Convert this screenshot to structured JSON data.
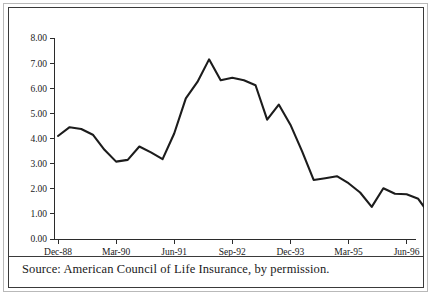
{
  "figure": {
    "source_caption": "Source: American Council of Life Insurance, by permission."
  },
  "chart_data": {
    "type": "line",
    "title": "",
    "subtitle": "",
    "xlabel": "",
    "ylabel": "",
    "grid": false,
    "legend": false,
    "legend_position": "none",
    "line_color": "#1c1c1c",
    "axis_color": "#2b2b2b",
    "background": "#ffffff",
    "ylim": [
      0.0,
      8.0
    ],
    "ytick_labels": [
      "8.00",
      "7.00",
      "6.00",
      "5.00",
      "4.00",
      "3.00",
      "2.00",
      "1.00",
      "0.00"
    ],
    "ytick_values": [
      8.0,
      7.0,
      6.0,
      5.0,
      4.0,
      3.0,
      2.0,
      1.0,
      0.0
    ],
    "xtick_labels": [
      "Dec-88",
      "Mar-90",
      "Jun-91",
      "Sep-92",
      "Dec-93",
      "Mar-95",
      "Jun-96"
    ],
    "xtick_indices": [
      0,
      5,
      10,
      15,
      20,
      25,
      30
    ],
    "x": [
      "Dec-88",
      "Mar-89",
      "Jun-89",
      "Sep-89",
      "Dec-89",
      "Mar-90",
      "Jun-90",
      "Sep-90",
      "Dec-90",
      "Mar-91",
      "Jun-91",
      "Sep-91",
      "Dec-91",
      "Mar-92",
      "Jun-92",
      "Sep-92",
      "Dec-92",
      "Mar-93",
      "Jun-93",
      "Sep-93",
      "Dec-93",
      "Mar-94",
      "Jun-94",
      "Sep-94",
      "Dec-94",
      "Mar-95",
      "Jun-95",
      "Sep-95",
      "Dec-95",
      "Mar-96",
      "Jun-96"
    ],
    "values": [
      4.1,
      4.45,
      4.38,
      4.15,
      3.55,
      3.08,
      3.15,
      3.68,
      3.45,
      3.18,
      4.2,
      5.6,
      6.25,
      7.15,
      6.32,
      6.42,
      6.32,
      6.12,
      4.75,
      5.35,
      4.55,
      3.5,
      2.35,
      2.42,
      2.5,
      2.22,
      1.85,
      1.28,
      2.02,
      1.8,
      1.78
    ],
    "series": [
      {
        "name": "series-1",
        "values": [
          4.1,
          4.45,
          4.38,
          4.15,
          3.55,
          3.08,
          3.15,
          3.68,
          3.45,
          3.18,
          4.2,
          5.6,
          6.25,
          7.15,
          6.32,
          6.42,
          6.32,
          6.12,
          4.75,
          5.35,
          4.55,
          3.5,
          2.35,
          2.42,
          2.5,
          2.22,
          1.85,
          1.28,
          2.02,
          1.8,
          1.78
        ]
      }
    ],
    "tail_values": [
      1.78,
      1.6,
      0.95,
      1.0,
      1.03
    ]
  }
}
